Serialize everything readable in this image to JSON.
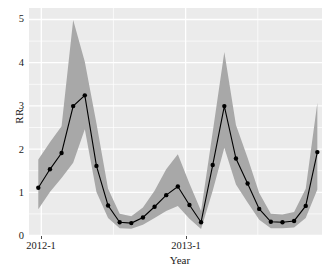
{
  "chart_data": {
    "type": "line",
    "title": "",
    "xlabel": "Year",
    "ylabel": "RR",
    "grid": true,
    "legend": false,
    "ylim": [
      0,
      5.3
    ],
    "yticks": [
      0,
      1,
      2,
      3,
      4,
      5
    ],
    "ytick_labels": [
      "0",
      "1",
      "2",
      "3",
      "4",
      "5"
    ],
    "xtick_labels": [
      "2012-1",
      "2013-1"
    ],
    "xtick_positions": [
      1,
      13
    ],
    "xlim": [
      0.2,
      25.4
    ],
    "x": [
      1,
      2,
      3,
      4,
      5,
      6,
      7,
      8,
      9,
      10,
      11,
      12,
      13,
      14,
      15,
      16,
      17,
      18,
      19,
      20,
      21,
      22,
      23,
      24,
      25
    ],
    "series": [
      {
        "name": "RR",
        "values": [
          1.12,
          1.55,
          1.93,
          3.02,
          3.27,
          1.63,
          0.71,
          0.32,
          0.3,
          0.43,
          0.68,
          0.95,
          1.15,
          0.72,
          0.32,
          1.65,
          3.02,
          1.8,
          1.22,
          0.63,
          0.33,
          0.32,
          0.35,
          0.7,
          1.95
        ],
        "upper": [
          1.78,
          2.18,
          2.55,
          5.02,
          4.05,
          2.62,
          1.1,
          0.52,
          0.46,
          0.66,
          1.05,
          1.55,
          1.9,
          1.22,
          0.58,
          2.42,
          4.28,
          2.58,
          1.82,
          1.0,
          0.52,
          0.5,
          0.56,
          1.1,
          3.1
        ],
        "lower": [
          0.62,
          1.02,
          1.35,
          1.7,
          2.48,
          1.02,
          0.42,
          0.18,
          0.17,
          0.26,
          0.42,
          0.58,
          0.7,
          0.4,
          0.16,
          1.05,
          2.05,
          1.2,
          0.78,
          0.38,
          0.18,
          0.18,
          0.2,
          0.42,
          1.08
        ]
      }
    ]
  },
  "style": {
    "panel_background": "#ebebeb",
    "grid_color": "#ffffff",
    "ribbon_color": "#a8a8a8",
    "line_color": "#000000",
    "point_color": "#000000",
    "text_color": "#1a1a1a"
  }
}
